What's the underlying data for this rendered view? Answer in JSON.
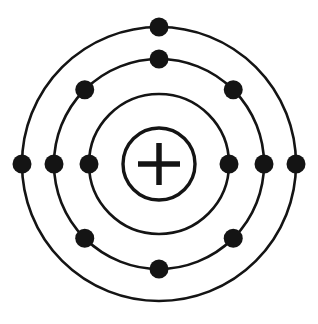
{
  "diagram": {
    "kind": "bohr-atom-model",
    "background_color": "#ffffff",
    "ink_color": "#141414",
    "canvas": {
      "width": 318,
      "height": 324
    },
    "center": {
      "x": 159,
      "y": 164
    }
  },
  "nucleus": {
    "label": "+",
    "radius": 36,
    "stroke_width": 3.4,
    "color": "#141414",
    "plus": {
      "arm_length": 21,
      "stroke_width": 5.5
    }
  },
  "electron": {
    "radius": 9.5,
    "color": "#141414"
  },
  "shells": [
    {
      "name": "shell-1",
      "index": 1,
      "radius": 70,
      "stroke_width": 2.6,
      "electron_count": 2,
      "electron_angles_deg": [
        180,
        0
      ]
    },
    {
      "name": "shell-2",
      "index": 2,
      "radius": 105,
      "stroke_width": 2.6,
      "electron_count": 8,
      "electron_angles_deg": [
        90,
        135,
        180,
        225,
        270,
        315,
        0,
        45
      ]
    },
    {
      "name": "shell-3",
      "index": 3,
      "radius": 137,
      "stroke_width": 2.6,
      "electron_count": 3,
      "electron_angles_deg": [
        90,
        180,
        0
      ]
    }
  ],
  "electron_configuration": {
    "counts": [
      2,
      8,
      3
    ],
    "total_electrons": 13
  }
}
